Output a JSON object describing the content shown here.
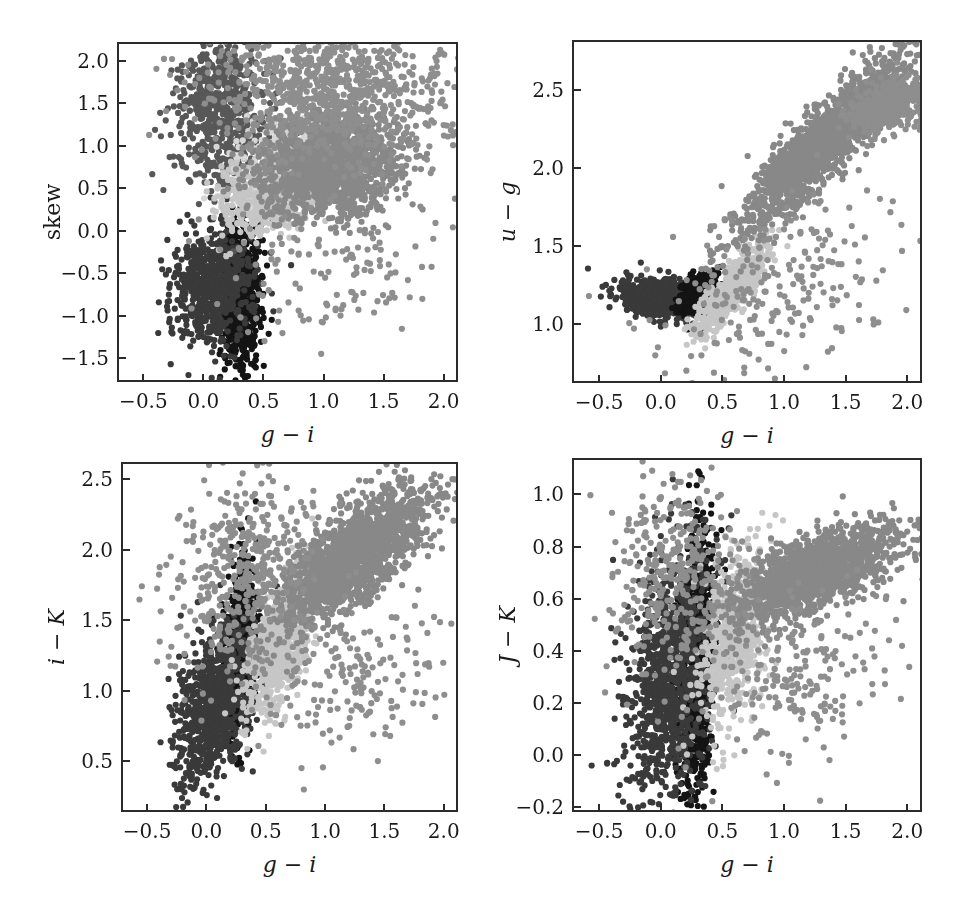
{
  "figure": {
    "width": 961,
    "height": 904,
    "background": "#ffffff",
    "layout": "2x2 grid of scatter panels",
    "cropped_header_text": ""
  },
  "colors": {
    "axis": "#2b2b2b",
    "text": "#1a1a1a",
    "cluster_darkest": "#141414",
    "cluster_dark": "#3a3a3a",
    "cluster_mid_dark": "#585858",
    "cluster_mid": "#888888",
    "cluster_light": "#b6b6b6",
    "cluster_lightest": "#d2d2d2"
  },
  "chart_data": [
    {
      "id": "panel-skew",
      "type": "scatter",
      "title": "",
      "xlabel": "g - i",
      "ylabel": "skew",
      "ylabel_style": "upright",
      "xlim": [
        -0.72,
        2.12
      ],
      "ylim": [
        -1.78,
        2.22
      ],
      "xticks": [
        -0.5,
        0.0,
        0.5,
        1.0,
        1.5,
        2.0
      ],
      "xticklabels": [
        "-0.5",
        "0.0",
        "0.5",
        "1.0",
        "1.5",
        "2.0"
      ],
      "yticks": [
        -1.5,
        -1.0,
        -0.5,
        0.0,
        0.5,
        1.0,
        1.5,
        2.0
      ],
      "yticklabels": [
        "-1.5",
        "-1.0",
        "-0.5",
        "0.0",
        "0.5",
        "1.0",
        "1.5",
        "2.0"
      ],
      "grid": false,
      "legend": "none",
      "frame": {
        "left": 117,
        "top": 42,
        "width": 341,
        "height": 340
      },
      "series": [
        {
          "name": "cluster-darkest",
          "color": "#141414",
          "n": 820,
          "cx": 0.28,
          "cy": -0.72,
          "sx": 0.085,
          "sy": 0.42,
          "rho": 0.05
        },
        {
          "name": "cluster-dark",
          "color": "#3a3a3a",
          "n": 700,
          "cx": 0.06,
          "cy": -0.62,
          "sx": 0.17,
          "sy": 0.33,
          "rho": 0.1
        },
        {
          "name": "cluster-mid-dark",
          "color": "#585858",
          "n": 620,
          "cx": 0.12,
          "cy": 1.45,
          "sx": 0.2,
          "sy": 0.42,
          "rho": 0.0
        },
        {
          "name": "cluster-light",
          "color": "#c6c6c6",
          "n": 480,
          "cx": 0.52,
          "cy": 0.45,
          "sx": 0.22,
          "sy": 0.25,
          "rho": 0.25
        },
        {
          "name": "cluster-lightest",
          "color": "#d6d6d6",
          "n": 260,
          "cx": 0.72,
          "cy": 0.92,
          "sx": 0.2,
          "sy": 0.2,
          "rho": 0.1
        },
        {
          "name": "cluster-mid",
          "color": "#888888",
          "n": 1450,
          "cx": 1.02,
          "cy": 0.78,
          "sx": 0.3,
          "sy": 0.3,
          "rho": 0.1
        },
        {
          "name": "cluster-scatter-hi",
          "color": "#8e8e8e",
          "n": 900,
          "cx": 1.05,
          "cy": 1.7,
          "sx": 0.52,
          "sy": 0.42,
          "rho": -0.1
        },
        {
          "name": "cluster-sparse-low",
          "color": "#8e8e8e",
          "n": 120,
          "cx": 1.0,
          "cy": -0.45,
          "sx": 0.45,
          "sy": 0.38,
          "rho": 0.0
        }
      ]
    },
    {
      "id": "panel-u-g",
      "type": "scatter",
      "title": "",
      "xlabel": "g - i",
      "ylabel": "u - g",
      "ylabel_style": "italic",
      "xlim": [
        -0.72,
        2.12
      ],
      "ylim": [
        0.62,
        2.82
      ],
      "xticks": [
        -0.5,
        0.0,
        0.5,
        1.0,
        1.5,
        2.0
      ],
      "xticklabels": [
        "-0.5",
        "0.0",
        "0.5",
        "1.0",
        "1.5",
        "2.0"
      ],
      "yticks": [
        1.0,
        1.5,
        2.0,
        2.5
      ],
      "yticklabels": [
        "1.0",
        "1.5",
        "2.0",
        "2.5"
      ],
      "grid": false,
      "legend": "none",
      "frame": {
        "left": 572,
        "top": 40,
        "width": 350,
        "height": 343
      },
      "series": [
        {
          "name": "cluster-dark",
          "color": "#3a3a3a",
          "n": 760,
          "cx": 0.02,
          "cy": 1.17,
          "sx": 0.17,
          "sy": 0.065,
          "rho": -0.25
        },
        {
          "name": "cluster-darkest",
          "color": "#141414",
          "n": 420,
          "cx": 0.29,
          "cy": 1.2,
          "sx": 0.07,
          "sy": 0.06,
          "rho": 0.2
        },
        {
          "name": "cluster-light",
          "color": "#c6c6c6",
          "n": 620,
          "cx": 0.55,
          "cy": 1.22,
          "sx": 0.14,
          "sy": 0.14,
          "rho": 0.85
        },
        {
          "name": "cluster-mid",
          "color": "#888888",
          "n": 1750,
          "cx": 1.32,
          "cy": 2.18,
          "sx": 0.33,
          "sy": 0.28,
          "rho": 0.9
        },
        {
          "name": "cluster-upper-arm",
          "color": "#8e8e8e",
          "n": 420,
          "cx": 1.85,
          "cy": 2.42,
          "sx": 0.16,
          "sy": 0.09,
          "rho": 0.35
        },
        {
          "name": "cluster-outliers",
          "color": "#8e8e8e",
          "n": 230,
          "cx": 0.9,
          "cy": 1.18,
          "sx": 0.5,
          "sy": 0.3,
          "rho": 0.35
        }
      ]
    },
    {
      "id": "panel-i-K",
      "type": "scatter",
      "title": "",
      "xlabel": "g - i",
      "ylabel": "i - K",
      "ylabel_style": "italic",
      "xlim": [
        -0.72,
        2.12
      ],
      "ylim": [
        0.14,
        2.62
      ],
      "xticks": [
        -0.5,
        0.0,
        0.5,
        1.0,
        1.5,
        2.0
      ],
      "xticklabels": [
        "-0.5",
        "0.0",
        "0.5",
        "1.0",
        "1.5",
        "2.0"
      ],
      "yticks": [
        0.5,
        1.0,
        1.5,
        2.0,
        2.5
      ],
      "yticklabels": [
        "0.5",
        "1.0",
        "1.5",
        "2.0",
        "2.5"
      ],
      "grid": false,
      "legend": "none",
      "frame": {
        "left": 121,
        "top": 462,
        "width": 337,
        "height": 350
      },
      "series": [
        {
          "name": "cluster-darkest",
          "color": "#141414",
          "n": 720,
          "cx": 0.26,
          "cy": 1.3,
          "sx": 0.07,
          "sy": 0.3,
          "rho": 0.3
        },
        {
          "name": "cluster-dark",
          "color": "#3a3a3a",
          "n": 860,
          "cx": 0.06,
          "cy": 0.92,
          "sx": 0.17,
          "sy": 0.28,
          "rho": 0.5
        },
        {
          "name": "cluster-light",
          "color": "#c6c6c6",
          "n": 700,
          "cx": 0.6,
          "cy": 1.36,
          "sx": 0.15,
          "sy": 0.26,
          "rho": 0.6
        },
        {
          "name": "cluster-mid",
          "color": "#888888",
          "n": 1700,
          "cx": 1.2,
          "cy": 1.95,
          "sx": 0.33,
          "sy": 0.25,
          "rho": 0.75
        },
        {
          "name": "cluster-sparse-upper",
          "color": "#8e8e8e",
          "n": 400,
          "cx": 0.25,
          "cy": 1.85,
          "sx": 0.3,
          "sy": 0.35,
          "rho": 0.3
        },
        {
          "name": "cluster-outliers",
          "color": "#8e8e8e",
          "n": 180,
          "cx": 1.25,
          "cy": 1.1,
          "sx": 0.4,
          "sy": 0.3,
          "rho": 0.2
        }
      ]
    },
    {
      "id": "panel-J-K",
      "type": "scatter",
      "title": "",
      "xlabel": "g - i",
      "ylabel": "J - K",
      "ylabel_style": "italic",
      "xlim": [
        -0.72,
        2.12
      ],
      "ylim": [
        -0.22,
        1.14
      ],
      "xticks": [
        -0.5,
        0.0,
        0.5,
        1.0,
        1.5,
        2.0
      ],
      "xticklabels": [
        "-0.5",
        "0.0",
        "0.5",
        "1.0",
        "1.5",
        "2.0"
      ],
      "yticks": [
        -0.2,
        0.0,
        0.2,
        0.4,
        0.6,
        0.8,
        1.0
      ],
      "yticklabels": [
        "-0.2",
        "0.0",
        "0.2",
        "0.4",
        "0.6",
        "0.8",
        "1.0"
      ],
      "grid": false,
      "legend": "none",
      "frame": {
        "left": 572,
        "top": 458,
        "width": 350,
        "height": 354
      },
      "series": [
        {
          "name": "cluster-darkest",
          "color": "#141414",
          "n": 900,
          "cx": 0.27,
          "cy": 0.35,
          "sx": 0.07,
          "sy": 0.25,
          "rho": 0.2
        },
        {
          "name": "cluster-dark",
          "color": "#3a3a3a",
          "n": 1000,
          "cx": 0.05,
          "cy": 0.3,
          "sx": 0.17,
          "sy": 0.24,
          "rho": 0.25
        },
        {
          "name": "cluster-light",
          "color": "#c6c6c6",
          "n": 620,
          "cx": 0.58,
          "cy": 0.45,
          "sx": 0.14,
          "sy": 0.17,
          "rho": 0.45
        },
        {
          "name": "cluster-mid",
          "color": "#888888",
          "n": 1550,
          "cx": 1.24,
          "cy": 0.71,
          "sx": 0.33,
          "sy": 0.09,
          "rho": 0.65
        },
        {
          "name": "cluster-sparse-upper",
          "color": "#8e8e8e",
          "n": 350,
          "cx": 0.1,
          "cy": 0.7,
          "sx": 0.25,
          "sy": 0.2,
          "rho": 0.1
        },
        {
          "name": "cluster-outliers",
          "color": "#8e8e8e",
          "n": 200,
          "cx": 1.15,
          "cy": 0.32,
          "sx": 0.38,
          "sy": 0.18,
          "rho": 0.3
        }
      ]
    }
  ]
}
